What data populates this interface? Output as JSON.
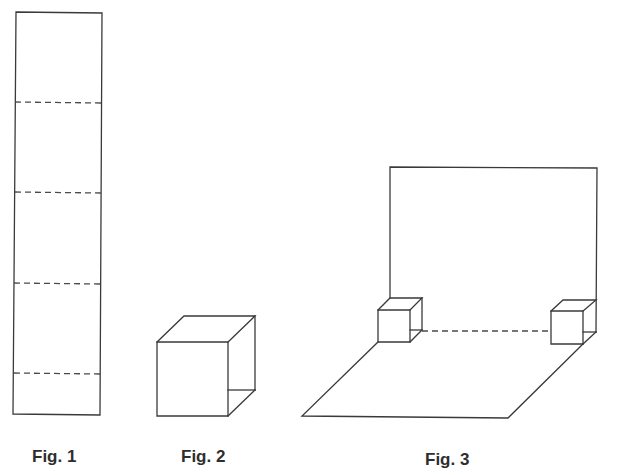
{
  "figures": [
    {
      "id": "fig1",
      "caption": "Fig. 1",
      "description": "Tall rectangular strip divided by four dashed fold lines",
      "fold_lines": 4
    },
    {
      "id": "fig2",
      "caption": "Fig. 2",
      "description": "Strip folded into an open cube / box shape"
    },
    {
      "id": "fig3",
      "caption": "Fig. 3",
      "description": "Upright back wall and floor parallelogram joined by two small cubes with a dashed fold line between them"
    }
  ],
  "colors": {
    "line": "#3a3a3a",
    "text": "#2e2e2e",
    "background": "#ffffff"
  }
}
